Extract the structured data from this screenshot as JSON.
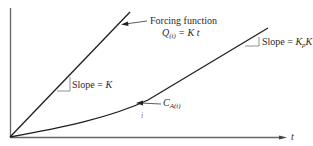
{
  "diagram": {
    "axes": {
      "x_label": "t"
    },
    "forcing_function": {
      "label_line1": "Forcing function",
      "label_q": "Q",
      "label_q_sub": "(t)",
      "label_eq": " = K t"
    },
    "response": {
      "label_c": "C",
      "label_c_sub": "A(t)",
      "small_mark": "i"
    },
    "slope_forcing": {
      "label": "Slope = ",
      "value": "K"
    },
    "slope_response": {
      "label": "Slope = ",
      "value_k": "K",
      "value_sub": "p",
      "value_k2": "K"
    },
    "colors": {
      "line": "#1e1e1e",
      "axis": "#555555"
    }
  }
}
